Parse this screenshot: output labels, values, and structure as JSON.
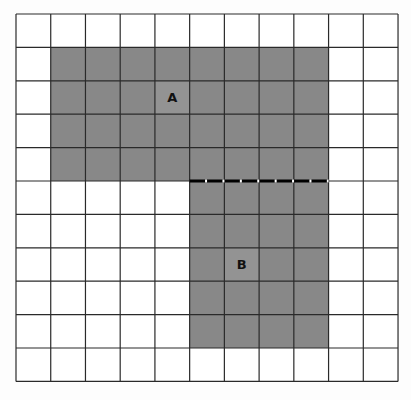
{
  "diagram": {
    "type": "grid-area-figure",
    "grid": {
      "columns": 11,
      "rows": 11,
      "origin_x": 16,
      "origin_y": 14,
      "cell_width": 34.73,
      "cell_height": 33.4,
      "line_color": "#2a2a2a",
      "background": "#ffffff"
    },
    "shapes": [
      {
        "id": "A",
        "label": "A",
        "fill": "#888888",
        "col_start": 1,
        "col_end": 9,
        "row_start": 1,
        "row_end": 5,
        "label_col": 4,
        "label_row": 2,
        "label_cell_fill": "#939393"
      },
      {
        "id": "B",
        "label": "B",
        "fill": "#888888",
        "col_start": 5,
        "col_end": 9,
        "row_start": 5,
        "row_end": 10,
        "label_col": 6,
        "label_row": 7,
        "label_cell_fill": "#939393"
      }
    ],
    "shared_boundary": {
      "style": "dashed",
      "row_line": 5,
      "col_start": 5,
      "col_end": 9,
      "color": "#000000",
      "gap_color": "#ffffff"
    }
  }
}
